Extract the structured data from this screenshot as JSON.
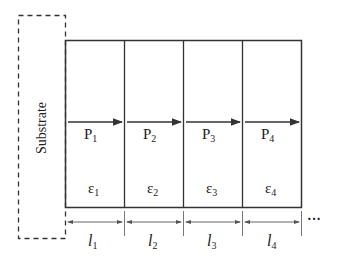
{
  "substrate": {
    "label": "Substrate"
  },
  "layers": [
    {
      "polarization": "P",
      "p_sub": "1",
      "strain": "ε",
      "e_sub": "1",
      "length": "l",
      "l_sub": "1"
    },
    {
      "polarization": "P",
      "p_sub": "2",
      "strain": "ε",
      "e_sub": "2",
      "length": "l",
      "l_sub": "2"
    },
    {
      "polarization": "P",
      "p_sub": "3",
      "strain": "ε",
      "e_sub": "3",
      "length": "l",
      "l_sub": "3"
    },
    {
      "polarization": "P",
      "p_sub": "4",
      "strain": "ε",
      "e_sub": "4",
      "length": "l",
      "l_sub": "4"
    }
  ],
  "continuation": "···"
}
